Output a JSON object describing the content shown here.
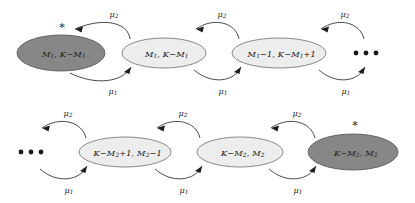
{
  "diagram": {
    "type": "markov-chain-state-transition",
    "title": "",
    "rows": [
      {
        "id": "top-row",
        "nodes": [
          {
            "id": "top-node-1",
            "shade": "dark",
            "marked": true,
            "marker": "*",
            "text": "M1, K−M1",
            "label_parts": [
              "M",
              "1",
              ", K−M",
              "1"
            ],
            "cx": 61,
            "cy": 53,
            "rx": 44,
            "ry": 18
          },
          {
            "id": "top-node-2",
            "shade": "light",
            "marked": false,
            "marker": "",
            "text": "M1, K−M1",
            "label_parts": [
              "M",
              "1",
              ", K−M",
              "1"
            ],
            "cx": 164,
            "cy": 53,
            "rx": 42,
            "ry": 15
          },
          {
            "id": "top-node-3",
            "shade": "light",
            "marked": false,
            "marker": "",
            "text": "M1−1, K−M1+1",
            "label_parts": [
              "M",
              "1",
              "−1, K−M",
              "1",
              "+1"
            ],
            "cx": 279,
            "cy": 53,
            "rx": 47,
            "ry": 15
          }
        ],
        "ellipsis": {
          "id": "top-ellipsis",
          "cx": 366,
          "cy": 53,
          "dots": 3
        },
        "ellipsis_side": "right",
        "edges": [
          {
            "from": "top-node-2",
            "to": "top-node-1",
            "rate": "μ2",
            "rate_base": "μ",
            "rate_sub": "2",
            "position": "above",
            "direction": "leftward"
          },
          {
            "from": "top-node-1",
            "to": "top-node-2",
            "rate": "μ1",
            "rate_base": "μ",
            "rate_sub": "1",
            "position": "below",
            "direction": "rightward"
          },
          {
            "from": "top-node-3",
            "to": "top-node-2",
            "rate": "μ2",
            "rate_base": "μ",
            "rate_sub": "2",
            "position": "above",
            "direction": "leftward"
          },
          {
            "from": "top-node-2",
            "to": "top-node-3",
            "rate": "μ1",
            "rate_base": "μ",
            "rate_sub": "1",
            "position": "below",
            "direction": "rightward"
          },
          {
            "from": "top-ellipsis",
            "to": "top-node-3",
            "rate": "μ2",
            "rate_base": "μ",
            "rate_sub": "2",
            "position": "above",
            "direction": "leftward"
          },
          {
            "from": "top-node-3",
            "to": "top-ellipsis",
            "rate": "μ1",
            "rate_base": "μ",
            "rate_sub": "1",
            "position": "below",
            "direction": "rightward"
          }
        ]
      },
      {
        "id": "bottom-row",
        "nodes": [
          {
            "id": "bottom-node-1",
            "shade": "light",
            "marked": false,
            "marker": "",
            "text": "K−M2+1, M2−1",
            "label_parts": [
              "K−M",
              "2",
              "+1, M",
              "2",
              "−1"
            ],
            "cx": 125,
            "cy": 152,
            "rx": 46,
            "ry": 15
          },
          {
            "id": "bottom-node-2",
            "shade": "light",
            "marked": false,
            "marker": "",
            "text": "K−M2, M2",
            "label_parts": [
              "K−M",
              "2",
              ", M",
              "2"
            ],
            "cx": 240,
            "cy": 152,
            "rx": 43,
            "ry": 15
          },
          {
            "id": "bottom-node-3",
            "shade": "dark",
            "marked": true,
            "marker": "*",
            "text": "K−M2, M2",
            "label_parts": [
              "K−M",
              "2",
              ", M",
              "2"
            ],
            "cx": 353,
            "cy": 152,
            "rx": 45,
            "ry": 18
          }
        ],
        "ellipsis": {
          "id": "bottom-ellipsis",
          "cx": 31,
          "cy": 152,
          "dots": 3
        },
        "ellipsis_side": "left",
        "edges": [
          {
            "from": "bottom-node-1",
            "to": "bottom-ellipsis",
            "rate": "μ2",
            "rate_base": "μ",
            "rate_sub": "2",
            "position": "above",
            "direction": "leftward"
          },
          {
            "from": "bottom-ellipsis",
            "to": "bottom-node-1",
            "rate": "μ1",
            "rate_base": "μ",
            "rate_sub": "1",
            "position": "below",
            "direction": "rightward"
          },
          {
            "from": "bottom-node-2",
            "to": "bottom-node-1",
            "rate": "μ2",
            "rate_base": "μ",
            "rate_sub": "2",
            "position": "above",
            "direction": "leftward"
          },
          {
            "from": "bottom-node-1",
            "to": "bottom-node-2",
            "rate": "μ1",
            "rate_base": "μ",
            "rate_sub": "1",
            "position": "below",
            "direction": "rightward"
          },
          {
            "from": "bottom-node-3",
            "to": "bottom-node-2",
            "rate": "μ2",
            "rate_base": "μ",
            "rate_sub": "2",
            "position": "above",
            "direction": "leftward"
          },
          {
            "from": "bottom-node-2",
            "to": "bottom-node-3",
            "rate": "μ1",
            "rate_base": "μ",
            "rate_sub": "1",
            "position": "below",
            "direction": "rightward"
          }
        ]
      }
    ],
    "rate_labels": {
      "mu2": "μ2",
      "mu1": "μ1",
      "mu_base": "μ",
      "sub_2": "2",
      "sub_1": "1"
    },
    "colors": {
      "dark_node_fill": "#878787",
      "dark_node_stroke": "#5d5d5d",
      "light_node_fill": "#ededed",
      "light_node_stroke": "#7a7a7a",
      "arrow": "#2b2b2b",
      "text": "#1a1a1a",
      "background": "#ffffff"
    }
  }
}
